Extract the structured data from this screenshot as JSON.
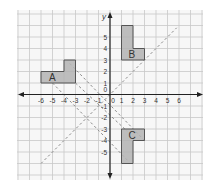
{
  "figure": {
    "type": "coordinate-grid",
    "axis_labels": {
      "x": "",
      "y": "y"
    },
    "origin_label": "0",
    "x_ticks": [
      -6,
      -5,
      -4,
      -3,
      -2,
      -1,
      1,
      2,
      3,
      4,
      5,
      6
    ],
    "y_ticks": [
      -5,
      -4,
      -3,
      -2,
      -1,
      1,
      2,
      3,
      4,
      5
    ],
    "grid_range": {
      "xmin": -8,
      "xmax": 8,
      "ymin": -7,
      "ymax": 7
    },
    "shapes": [
      {
        "label": "A",
        "points": [
          [
            -6,
            2
          ],
          [
            -4,
            2
          ],
          [
            -4,
            3
          ],
          [
            -3,
            3
          ],
          [
            -3,
            1
          ],
          [
            -6,
            1
          ]
        ],
        "label_at": [
          -5.3,
          1.5
        ]
      },
      {
        "label": "B",
        "points": [
          [
            1,
            6
          ],
          [
            2,
            6
          ],
          [
            2,
            4
          ],
          [
            3,
            4
          ],
          [
            3,
            3
          ],
          [
            1,
            3
          ]
        ],
        "label_at": [
          1.6,
          3.5
        ]
      },
      {
        "label": "C",
        "points": [
          [
            1,
            -3
          ],
          [
            3,
            -3
          ],
          [
            3,
            -4
          ],
          [
            2,
            -4
          ],
          [
            2,
            -6
          ],
          [
            1,
            -6
          ]
        ],
        "label_at": [
          1.6,
          -3.5
        ]
      }
    ],
    "dashed_lines": [
      {
        "name": "line-y-equals-x",
        "from": [
          -6,
          -6
        ],
        "to": [
          5.8,
          5.8
        ]
      },
      {
        "name": "line-a-to-c-upper",
        "from": [
          -3.5,
          2.7
        ],
        "to": [
          3,
          -4
        ]
      },
      {
        "name": "line-a-to-c-middle",
        "from": [
          -3,
          1
        ],
        "to": [
          1.5,
          -3.2
        ]
      },
      {
        "name": "line-a-to-c-lower",
        "from": [
          -5,
          1
        ],
        "to": [
          1.6,
          -5.8
        ]
      }
    ],
    "colors": {
      "grid": "#c8c8c8",
      "axis": "#222222",
      "shape_fill": "#b3b3b3",
      "shape_stroke": "#555555",
      "dashed": "#8a8a8a",
      "text": "#333333",
      "background": "#f7f7f7"
    }
  }
}
